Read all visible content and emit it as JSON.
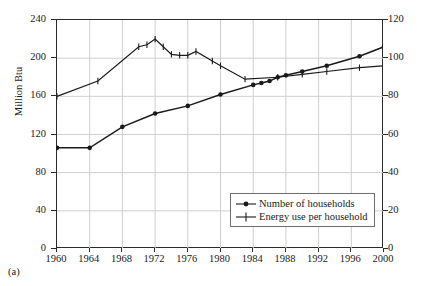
{
  "caption": "(a)",
  "chart_data": {
    "type": "line",
    "title": "",
    "xlabel": "",
    "ylabel": "Million Btu",
    "ylabel_right": "Million households",
    "xlim": [
      1960,
      2000
    ],
    "ylim": [
      0,
      240
    ],
    "ylim_right": [
      0,
      120
    ],
    "grid": true,
    "legend_position": "bottom-right",
    "x_ticks": [
      "1960",
      "1964",
      "1968",
      "1972",
      "1976",
      "1980",
      "1984",
      "1988",
      "1992",
      "1996",
      "2000"
    ],
    "y_ticks_left": [
      "0",
      "40",
      "80",
      "120",
      "160",
      "200",
      "240"
    ],
    "y_ticks_right": [
      "0",
      "20",
      "40",
      "60",
      "80",
      "100",
      "120"
    ],
    "series": [
      {
        "name": "Number of households",
        "axis": "right",
        "marker": "filled-circle",
        "color": "#1a1a1a",
        "x": [
          1960,
          1964,
          1968,
          1972,
          1976,
          1980,
          1984,
          1985,
          1986,
          1987,
          1988,
          1990,
          1993,
          1997,
          2000
        ],
        "values": [
          53,
          53,
          64,
          71,
          75,
          81,
          86,
          87,
          88,
          90,
          91,
          93,
          96,
          101,
          106
        ]
      },
      {
        "name": "Energy use per household",
        "axis": "left",
        "marker": "plus",
        "color": "#1a1a1a",
        "x": [
          1960,
          1965,
          1970,
          1971,
          1972,
          1973,
          1974,
          1975,
          1976,
          1977,
          1979,
          1980,
          1983,
          1987,
          1990,
          1993,
          1997,
          2000
        ],
        "values": [
          160,
          176,
          212,
          214,
          220,
          212,
          204,
          203,
          203,
          207,
          197,
          192,
          178,
          180,
          183,
          186,
          190,
          192
        ]
      }
    ]
  }
}
